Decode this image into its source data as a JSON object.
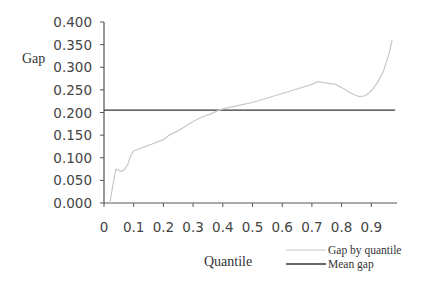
{
  "chart_data": {
    "type": "line",
    "title": "",
    "xlabel": "Quantile",
    "ylabel": "Gap",
    "xlim": [
      0,
      0.98
    ],
    "ylim": [
      0,
      0.4
    ],
    "grid": false,
    "legend_position": "bottom-right",
    "x_ticks": [
      "0",
      "0.1",
      "0.2",
      "0.3",
      "0.4",
      "0.5",
      "0.6",
      "0.7",
      "0.8",
      "0.9"
    ],
    "y_ticks": [
      "0.000",
      "0.050",
      "0.100",
      "0.150",
      "0.200",
      "0.250",
      "0.300",
      "0.350",
      "0.400"
    ],
    "series": [
      {
        "name": "Gap by quantile",
        "color": "#c8c8c8",
        "x": [
          0.02,
          0.03,
          0.04,
          0.05,
          0.06,
          0.07,
          0.08,
          0.09,
          0.1,
          0.12,
          0.14,
          0.16,
          0.18,
          0.2,
          0.22,
          0.25,
          0.28,
          0.3,
          0.33,
          0.36,
          0.38,
          0.4,
          0.45,
          0.5,
          0.55,
          0.6,
          0.65,
          0.7,
          0.72,
          0.75,
          0.78,
          0.8,
          0.83,
          0.86,
          0.88,
          0.9,
          0.92,
          0.94,
          0.96,
          0.97
        ],
        "values": [
          0.0,
          0.04,
          0.075,
          0.072,
          0.07,
          0.075,
          0.085,
          0.105,
          0.115,
          0.12,
          0.125,
          0.13,
          0.135,
          0.14,
          0.15,
          0.16,
          0.172,
          0.18,
          0.19,
          0.197,
          0.203,
          0.208,
          0.215,
          0.222,
          0.232,
          0.242,
          0.252,
          0.262,
          0.268,
          0.265,
          0.262,
          0.255,
          0.243,
          0.235,
          0.237,
          0.248,
          0.265,
          0.29,
          0.33,
          0.36
        ]
      },
      {
        "name": "Mean gap",
        "color": "#333333",
        "x": [
          0,
          0.98
        ],
        "values": [
          0.205,
          0.205
        ]
      }
    ]
  }
}
